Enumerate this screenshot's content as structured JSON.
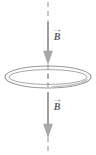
{
  "figure": {
    "name": "magnetic-field-through-conducting-loop",
    "background_color": "#ffffff",
    "width": 96,
    "height": 155,
    "stroke_color": "#8f8f8f",
    "arrow_fill_color": "#a8a8a8",
    "label_color": "#5e5e5e",
    "axis": {
      "name": "symmetry-axis",
      "style": "dashed",
      "orientation": "vertical",
      "x": 48,
      "y_top": 2,
      "y_bottom": 153,
      "dash_pattern": "5,4"
    },
    "loop": {
      "name": "conducting-loop",
      "shape": "ellipse-ring-perspective",
      "center_x": 48,
      "center_y": 77,
      "outer_rx": 43,
      "outer_ry": 11,
      "inner_rx": 39,
      "inner_ry": 7.5,
      "fill": "#fbfbfb"
    },
    "arrows": [
      {
        "name": "field-arrow-top",
        "direction": "down",
        "x": 48,
        "y_start": 22,
        "y_tip": 64,
        "head_width": 9,
        "head_length": 13,
        "label": "B",
        "label_vector_accent": "→"
      },
      {
        "name": "field-arrow-bottom",
        "direction": "down",
        "x": 48,
        "y_start": 92,
        "y_tip": 137,
        "head_width": 9,
        "head_length": 13,
        "label": "B",
        "label_vector_accent": "→"
      }
    ],
    "labels": {
      "top_field": "B",
      "top_field_accent": "→",
      "bottom_field": "B",
      "bottom_field_accent": "→"
    }
  }
}
